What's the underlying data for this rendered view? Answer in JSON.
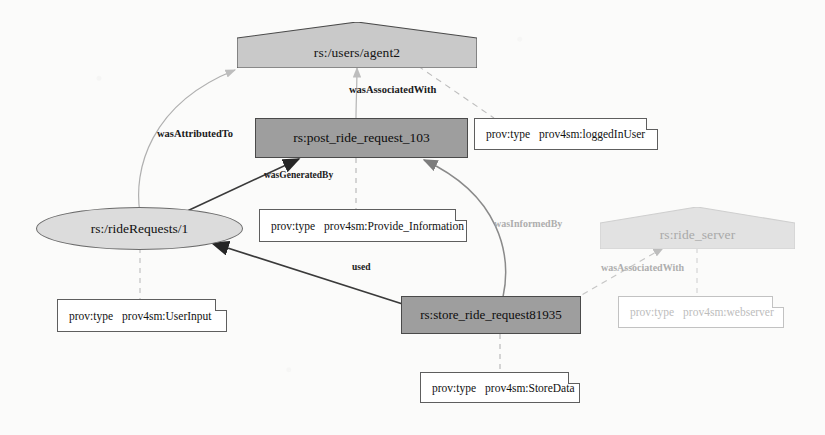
{
  "diagram": {
    "colors": {
      "agent_fill": "#c9c9c9",
      "agent_faded_fill": "#e2e2e2",
      "activity_fill": "#9e9e9e",
      "entity_fill": "#dcdcdc",
      "note_fill": "#ffffff",
      "stroke": "#4a4a4a",
      "faded_stroke": "#c2c2c2",
      "background": "#fbfbfa"
    }
  },
  "nodes": [
    {
      "id": "agent2",
      "kind": "agent",
      "label": "rs:/users/agent2"
    },
    {
      "id": "post",
      "kind": "activity",
      "label": "rs:post_ride_request_103"
    },
    {
      "id": "rideRequests",
      "kind": "entity",
      "label": "rs:/rideRequests/1"
    },
    {
      "id": "store",
      "kind": "activity",
      "label": "rs:store_ride_request81935"
    },
    {
      "id": "rideServer",
      "kind": "agent",
      "label": "rs:ride_server",
      "faded": true
    }
  ],
  "annotations": [
    {
      "id": "note-loggedinuser",
      "key": "prov:type",
      "value": "prov4sm:loggedInUser"
    },
    {
      "id": "note-provide-information",
      "key": "prov:type",
      "value": "prov4sm:Provide_Information"
    },
    {
      "id": "note-userinput",
      "key": "prov:type",
      "value": "prov4sm:UserInput"
    },
    {
      "id": "note-storedata",
      "key": "prov:type",
      "value": "prov4sm:StoreData"
    },
    {
      "id": "note-webserver",
      "key": "prov:type",
      "value": "prov4sm:webserver",
      "faded": true
    }
  ],
  "edges": [
    {
      "id": "e-wasassociatedwith-post",
      "label": "wasAssociatedWith",
      "from": "post",
      "to": "agent2",
      "style": "solid"
    },
    {
      "id": "e-wasattributedto",
      "label": "wasAttributedTo",
      "from": "rideRequests",
      "to": "agent2",
      "style": "solid"
    },
    {
      "id": "e-wasgeneratedby",
      "label": "wasGeneratedBy",
      "from": "rideRequests",
      "to": "post",
      "style": "solid"
    },
    {
      "id": "e-wasinformedby",
      "label": "wasInformedBy",
      "from": "store",
      "to": "post",
      "style": "solid"
    },
    {
      "id": "e-used",
      "label": "used",
      "from": "store",
      "to": "rideRequests",
      "style": "solid"
    },
    {
      "id": "e-wasassociatedwith-store",
      "label": "wasAssociatedWith",
      "from": "store",
      "to": "rideServer",
      "style": "dashed",
      "faded": true
    }
  ]
}
